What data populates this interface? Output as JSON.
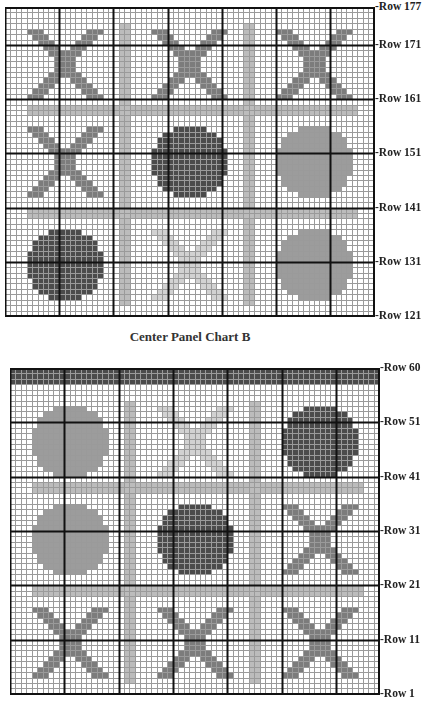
{
  "colors": {
    "grid_thin": "#9a9a9a",
    "grid_thick": "#111111",
    "dark": "#4b4b4b",
    "x_medium": "#7c7c7c",
    "circle_medium": "#9c9c9c",
    "bar_light": "#bcbcbc",
    "x_light": "#d2d2d2"
  },
  "caption": "Center Panel Chart B",
  "charts": [
    {
      "id": "top",
      "left": 5,
      "top": 7,
      "cols": 68,
      "rows": 57,
      "cell": 5.42,
      "thick_col_offset": 0,
      "thick_row_offset": 7,
      "labels": [
        {
          "text": "-Row 177",
          "row": 0
        },
        {
          "text": "-Row 171",
          "row": 7
        },
        {
          "text": "-Row 161",
          "row": 17
        },
        {
          "text": "-Row 151",
          "row": 27
        },
        {
          "text": "-Row 141",
          "row": 37
        },
        {
          "text": "-Row 131",
          "row": 47
        },
        {
          "text": "-Row 121",
          "row": 57
        }
      ],
      "shapes": [
        {
          "type": "rect",
          "color": "bar_light",
          "c": 21,
          "r": 3,
          "w": 2,
          "h": 52
        },
        {
          "type": "rect",
          "color": "bar_light",
          "c": 44,
          "r": 3,
          "w": 2,
          "h": 52
        },
        {
          "type": "rect",
          "color": "bar_light",
          "c": 4,
          "r": 18,
          "w": 61,
          "h": 2
        },
        {
          "type": "rect",
          "color": "bar_light",
          "c": 4,
          "r": 37,
          "w": 61,
          "h": 2
        },
        {
          "type": "x",
          "color": "x_medium",
          "c": 4,
          "r": 4,
          "size": 14
        },
        {
          "type": "x",
          "color": "x_medium",
          "c": 27,
          "r": 4,
          "size": 14
        },
        {
          "type": "x",
          "color": "x_medium",
          "c": 50,
          "r": 4,
          "size": 14
        },
        {
          "type": "x",
          "color": "x_medium",
          "c": 4,
          "r": 22,
          "size": 14
        },
        {
          "type": "circle",
          "color": "dark",
          "c": 27,
          "r": 22,
          "size": 14
        },
        {
          "type": "circle",
          "color": "circle_medium",
          "c": 50,
          "r": 22,
          "size": 14
        },
        {
          "type": "circle",
          "color": "dark",
          "c": 4,
          "r": 41,
          "size": 14
        },
        {
          "type": "x",
          "color": "x_light",
          "c": 27,
          "r": 41,
          "size": 14
        },
        {
          "type": "circle",
          "color": "circle_medium",
          "c": 50,
          "r": 41,
          "size": 14
        }
      ]
    },
    {
      "id": "bottom",
      "left": 10,
      "top": 368,
      "cols": 68,
      "rows": 60,
      "cell": 5.43,
      "thick_col_offset": 0,
      "thick_row_offset": 0,
      "labels": [
        {
          "text": "-Row 60",
          "row": 0
        },
        {
          "text": "-Row 51",
          "row": 10
        },
        {
          "text": "-Row 41",
          "row": 20
        },
        {
          "text": "-Row 31",
          "row": 30
        },
        {
          "text": "-Row 21",
          "row": 40
        },
        {
          "text": "-Row 11",
          "row": 50
        },
        {
          "text": "-Row 1",
          "row": 60
        }
      ],
      "shapes": [
        {
          "type": "rect",
          "color": "dark",
          "c": 0,
          "r": 0,
          "w": 68,
          "h": 3
        },
        {
          "type": "rect",
          "color": "bar_light",
          "c": 21,
          "r": 6,
          "w": 2,
          "h": 52
        },
        {
          "type": "rect",
          "color": "bar_light",
          "c": 44,
          "r": 6,
          "w": 2,
          "h": 52
        },
        {
          "type": "rect",
          "color": "bar_light",
          "c": 4,
          "r": 21,
          "w": 61,
          "h": 2
        },
        {
          "type": "rect",
          "color": "bar_light",
          "c": 4,
          "r": 40,
          "w": 61,
          "h": 2
        },
        {
          "type": "circle",
          "color": "circle_medium",
          "c": 4,
          "r": 7,
          "size": 14
        },
        {
          "type": "x",
          "color": "x_light",
          "c": 27,
          "r": 7,
          "size": 14
        },
        {
          "type": "circle",
          "color": "dark",
          "c": 50,
          "r": 7,
          "size": 14
        },
        {
          "type": "circle",
          "color": "circle_medium",
          "c": 4,
          "r": 25,
          "size": 14
        },
        {
          "type": "circle",
          "color": "dark",
          "c": 27,
          "r": 25,
          "size": 14
        },
        {
          "type": "x",
          "color": "x_medium",
          "c": 50,
          "r": 25,
          "size": 14
        },
        {
          "type": "x",
          "color": "x_medium",
          "c": 4,
          "r": 44,
          "size": 14
        },
        {
          "type": "x",
          "color": "x_medium",
          "c": 27,
          "r": 44,
          "size": 14
        },
        {
          "type": "x",
          "color": "x_medium",
          "c": 50,
          "r": 44,
          "size": 14
        }
      ]
    }
  ]
}
